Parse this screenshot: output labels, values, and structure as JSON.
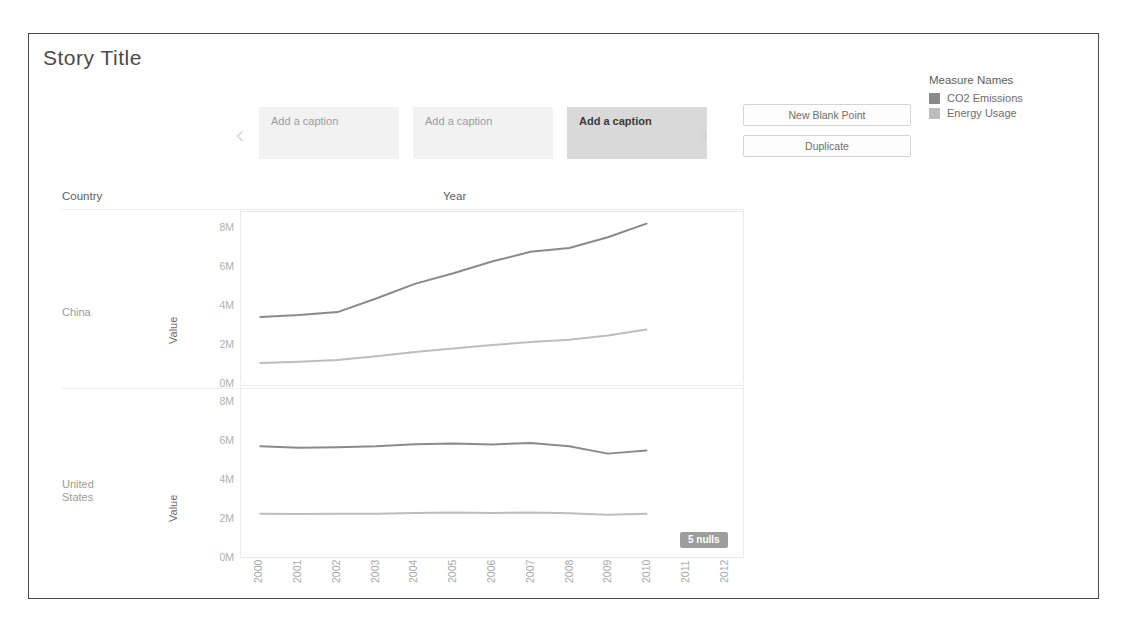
{
  "story": {
    "title": "Story Title",
    "nav": {
      "prev_icon": "chevron-left-icon",
      "next_icon": "chevron-right-icon",
      "prev_glyph": "‹",
      "next_glyph": "›"
    },
    "captions": [
      {
        "label": "Add a caption",
        "active": false
      },
      {
        "label": "Add a caption",
        "active": false
      },
      {
        "label": "Add a caption",
        "active": true
      }
    ],
    "actions": {
      "new_blank_point": "New Blank Point",
      "duplicate": "Duplicate"
    }
  },
  "viz": {
    "country_header": "Country",
    "year_header": "Year",
    "value_axis_title": "Value",
    "nulls_badge": "5 nulls",
    "rows": [
      {
        "label": "China"
      },
      {
        "label": "United\nStates"
      }
    ]
  },
  "legend": {
    "title": "Measure Names",
    "entries": [
      {
        "label": "CO2 Emissions",
        "color": "#8a8a8a"
      },
      {
        "label": "Energy Usage",
        "color": "#bdbdbd"
      }
    ]
  },
  "chart_data": {
    "type": "line",
    "title": "Year",
    "xlabel": "Year",
    "ylabel": "Value",
    "grid": false,
    "legend_position": "right",
    "x": [
      2000,
      2001,
      2002,
      2003,
      2004,
      2005,
      2006,
      2007,
      2008,
      2009,
      2010,
      2011,
      2012
    ],
    "xtick_labels": [
      "2000",
      "2001",
      "2002",
      "2003",
      "2004",
      "2005",
      "2006",
      "2007",
      "2008",
      "2009",
      "2010",
      "2011",
      "2012"
    ],
    "ylim": [
      0,
      8800000
    ],
    "ytick_values": [
      0,
      2000000,
      4000000,
      6000000,
      8000000
    ],
    "ytick_labels": [
      "0M",
      "2M",
      "4M",
      "6M",
      "8M"
    ],
    "panels": [
      {
        "name": "China",
        "series": [
          {
            "name": "CO2 Emissions",
            "color": "#8a8a8a",
            "values": [
              3400000,
              3500000,
              3650000,
              4350000,
              5100000,
              5650000,
              6250000,
              6750000,
              6950000,
              7500000,
              8200000,
              null,
              null
            ]
          },
          {
            "name": "Energy Usage",
            "color": "#bdbdbd",
            "values": [
              1030000,
              1090000,
              1180000,
              1380000,
              1600000,
              1780000,
              1950000,
              2110000,
              2230000,
              2450000,
              2750000,
              null,
              null
            ]
          }
        ]
      },
      {
        "name": "United States",
        "series": [
          {
            "name": "CO2 Emissions",
            "color": "#8a8a8a",
            "values": [
              5700000,
              5620000,
              5650000,
              5700000,
              5800000,
              5840000,
              5790000,
              5870000,
              5700000,
              5320000,
              5480000,
              null,
              null
            ]
          },
          {
            "name": "Energy Usage",
            "color": "#bdbdbd",
            "values": [
              2230000,
              2210000,
              2220000,
              2230000,
              2270000,
              2290000,
              2260000,
              2290000,
              2250000,
              2180000,
              2230000,
              null,
              null
            ]
          }
        ]
      }
    ]
  }
}
